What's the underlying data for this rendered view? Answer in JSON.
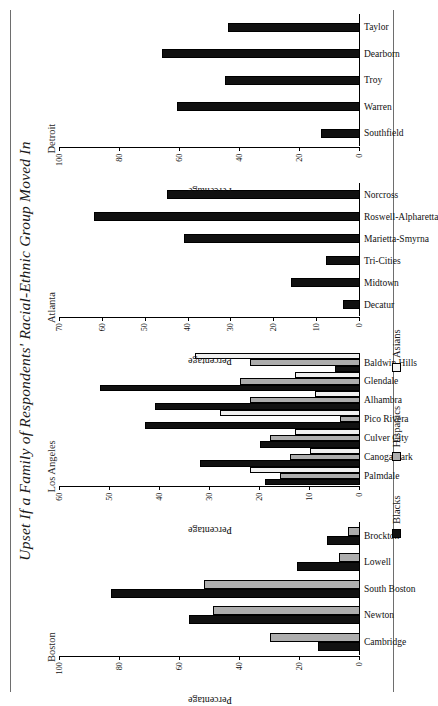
{
  "chart_data": {
    "type": "bar",
    "title": "Upset If a Family of Respondents' Racial-Ethnic Group Moved In",
    "ylabel": "Percentage",
    "xlabel": "",
    "grid": false,
    "legend_position": "bottom",
    "legend": [
      {
        "name": "Blacks",
        "color": "#111111"
      },
      {
        "name": "Hispanics",
        "color": "#adadad"
      },
      {
        "name": "Asians",
        "color": "#f0f0f0"
      }
    ],
    "panels": [
      {
        "name": "Boston",
        "ylim": [
          0,
          100
        ],
        "yticks": [
          0,
          20,
          40,
          60,
          80,
          100
        ],
        "ytick_labels": [
          "0",
          "20",
          "40",
          "60",
          "80",
          "100"
        ],
        "axis_caption": "Percentage",
        "categories": [
          "Cambridge",
          "Newton",
          "South Boston",
          "Lowell",
          "Brockton"
        ],
        "series": [
          {
            "name": "Blacks",
            "values": [
              14,
              57,
              83,
              21,
              11
            ]
          },
          {
            "name": "Hispanics",
            "values": [
              30,
              49,
              52,
              7,
              4
            ]
          }
        ]
      },
      {
        "name": "Los Angeles",
        "ylim": [
          0,
          60
        ],
        "yticks": [
          0,
          10,
          20,
          30,
          40,
          50,
          60
        ],
        "ytick_labels": [
          "0",
          "10",
          "20",
          "30",
          "40",
          "50",
          "60"
        ],
        "axis_caption": "Percentage",
        "categories": [
          "Palmdale",
          "Canoga Park",
          "Culver City",
          "Pico Rivera",
          "Alhambra",
          "Glendale",
          "Baldwin Hills"
        ],
        "series": [
          {
            "name": "Blacks",
            "values": [
              19,
              32,
              20,
              43,
              41,
              52,
              5
            ]
          },
          {
            "name": "Hispanics",
            "values": [
              16,
              14,
              18,
              4,
              22,
              24,
              22
            ]
          },
          {
            "name": "Asians",
            "values": [
              22,
              10,
              13,
              28,
              9,
              13,
              33
            ]
          }
        ]
      },
      {
        "name": "Atlanta",
        "ylim": [
          0,
          70
        ],
        "yticks": [
          0,
          10,
          20,
          30,
          40,
          50,
          60,
          70
        ],
        "ytick_labels": [
          "0",
          "10",
          "20",
          "30",
          "40",
          "50",
          "60",
          "70"
        ],
        "axis_caption": "Percentage",
        "categories": [
          "Decatur",
          "Midtown",
          "Tri-Cities",
          "Marietta-Smyrna",
          "Roswell-Alpharetta",
          "Norcross"
        ],
        "series": [
          {
            "name": "Blacks",
            "values": [
              4,
              16,
              8,
              41,
              62,
              45
            ]
          }
        ]
      },
      {
        "name": "Detroit",
        "ylim": [
          0,
          100
        ],
        "yticks": [
          0,
          20,
          40,
          60,
          80,
          100
        ],
        "ytick_labels": [
          "0",
          "20",
          "40",
          "60",
          "80",
          "100"
        ],
        "axis_caption": "Percentage",
        "categories": [
          "Southfield",
          "Warren",
          "Troy",
          "Dearborn",
          "Taylor"
        ],
        "series": [
          {
            "name": "Blacks",
            "values": [
              13,
              61,
              45,
              66,
              44
            ]
          }
        ]
      }
    ]
  }
}
